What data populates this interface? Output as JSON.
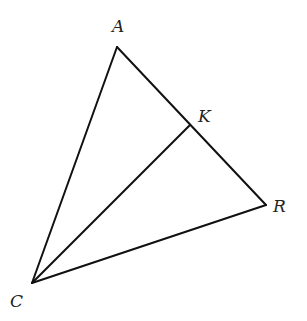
{
  "diagram": {
    "type": "geometry-triangle",
    "points": {
      "A": {
        "label": "A",
        "x": 117,
        "y": 47,
        "label_x": 112,
        "label_y": 32
      },
      "K": {
        "label": "K",
        "x": 190,
        "y": 125,
        "label_x": 198,
        "label_y": 122
      },
      "R": {
        "label": "R",
        "x": 266,
        "y": 205,
        "label_x": 273,
        "label_y": 212
      },
      "C": {
        "label": "C",
        "x": 32,
        "y": 283,
        "label_x": 10,
        "label_y": 307
      }
    },
    "segments": [
      {
        "name": "segment-AC",
        "from": "A",
        "to": "C"
      },
      {
        "name": "segment-AR",
        "from": "A",
        "to": "R"
      },
      {
        "name": "segment-CR",
        "from": "C",
        "to": "R"
      },
      {
        "name": "segment-CK",
        "from": "C",
        "to": "K"
      }
    ],
    "colors": {
      "stroke": "#111111",
      "label": "#222222",
      "background": "#ffffff"
    }
  }
}
